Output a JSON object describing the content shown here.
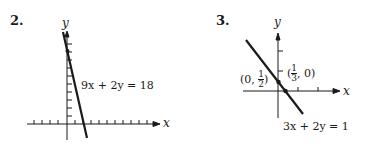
{
  "problems": [
    {
      "number": "2.",
      "y_axis_label": "y",
      "x_axis_label": "x",
      "equation": "9x + 2y = 18",
      "points": [
        {
          "label": "(0, 9)",
          "x": 0,
          "y": 9
        }
      ]
    },
    {
      "number": "3.",
      "y_axis_label": "y",
      "x_axis_label": "x",
      "equation": "3x + 2y = 1",
      "points": [
        {
          "label_prefix": "(0, ",
          "frac_num": "1",
          "frac_den": "2",
          "label_suffix": ")",
          "x": 0,
          "y": 0.5
        },
        {
          "label_prefix": "(",
          "frac_num": "1",
          "frac_den": "3",
          "label_suffix": ", 0)",
          "x": 0.333,
          "y": 0
        }
      ]
    }
  ],
  "colors": {
    "ink": "#1a1a1a",
    "background": "#ffffff"
  }
}
